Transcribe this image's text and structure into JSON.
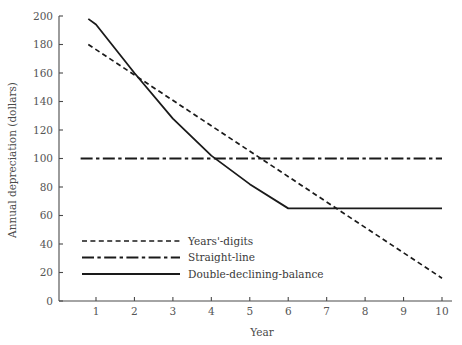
{
  "chart_data": {
    "type": "line",
    "title": "",
    "xlabel": "Year",
    "ylabel": "Annual depreciation (dollars)",
    "xlim": [
      0.6,
      10
    ],
    "ylim": [
      0,
      200
    ],
    "grid": false,
    "legend_position": "lower-left-inside",
    "x_ticks": [
      1,
      2,
      3,
      4,
      5,
      6,
      7,
      8,
      9,
      10
    ],
    "x_tick_labels": [
      "1",
      "2",
      "3",
      "4",
      "5",
      "6",
      "7",
      "8",
      "9",
      "10"
    ],
    "y_ticks": [
      0,
      20,
      40,
      60,
      80,
      100,
      120,
      140,
      160,
      180,
      200
    ],
    "y_tick_labels": [
      "0",
      "20",
      "40",
      "60",
      "80",
      "100",
      "120",
      "140",
      "160",
      "180",
      "200"
    ],
    "x": [
      1,
      2,
      3,
      4,
      5,
      6,
      7,
      8,
      9,
      10
    ],
    "series": [
      {
        "name": "Years'-digits",
        "style": "dashed",
        "color": "#1a1a1a",
        "x": [
          0.8,
          10
        ],
        "values": [
          180,
          16
        ]
      },
      {
        "name": "Straight-line",
        "style": "dash-dot",
        "color": "#1a1a1a",
        "x": [
          0.6,
          10
        ],
        "values": [
          100,
          100
        ]
      },
      {
        "name": "Double-declining-balance",
        "style": "solid",
        "color": "#1a1a1a",
        "x": [
          0.8,
          1,
          2,
          3,
          4,
          5,
          6,
          7,
          8,
          9,
          10
        ],
        "values": [
          198,
          194,
          160,
          128,
          102,
          82,
          65,
          65,
          65,
          65,
          65
        ]
      }
    ]
  },
  "legend": {
    "items": [
      {
        "label": "Years'-digits",
        "style": "dashed"
      },
      {
        "label": "Straight-line",
        "style": "dash-dot"
      },
      {
        "label": "Double-declining-balance",
        "style": "solid"
      }
    ]
  }
}
